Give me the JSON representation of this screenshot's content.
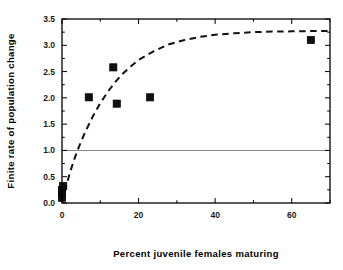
{
  "figure": {
    "background_color": "#ffffff",
    "frame_color": "#000000",
    "marker_color": "#111111",
    "curve_color": "#111111",
    "reference_line_color": "#8c8c8c"
  },
  "axes": {
    "x_title": "Percent juvenile females maturing",
    "y_title": "Finite rate of population change",
    "x_ticks": [
      "0",
      "20",
      "40",
      "60"
    ],
    "y_ticks": [
      "0.0",
      "0.5",
      "1.0",
      "1.5",
      "2.0",
      "2.5",
      "3.0",
      "3.5"
    ]
  },
  "chart_data": {
    "type": "scatter",
    "title": "",
    "xlabel": "Percent juvenile females maturing",
    "ylabel": "Finite rate of population change",
    "xlim": [
      0,
      70
    ],
    "ylim": [
      0,
      3.5
    ],
    "xticks": [
      0,
      20,
      40,
      60
    ],
    "xticks_minor": [
      10,
      30,
      50,
      70
    ],
    "yticks": [
      0.0,
      0.5,
      1.0,
      1.5,
      2.0,
      2.5,
      3.0,
      3.5
    ],
    "yticks_minor": [
      0.25,
      0.75,
      1.25,
      1.75,
      2.25,
      2.75,
      3.25
    ],
    "grid": false,
    "legend": null,
    "marker": "filled-square",
    "series": [
      {
        "name": "observed populations",
        "type": "scatter",
        "points": [
          {
            "x": 0.0,
            "y": 0.1
          },
          {
            "x": 0.0,
            "y": 0.18
          },
          {
            "x": 0.0,
            "y": 0.25
          },
          {
            "x": 0.3,
            "y": 0.32
          },
          {
            "x": 7.0,
            "y": 2.01
          },
          {
            "x": 13.4,
            "y": 2.58
          },
          {
            "x": 14.3,
            "y": 1.89
          },
          {
            "x": 23.0,
            "y": 2.01
          },
          {
            "x": 65.0,
            "y": 3.1
          }
        ]
      },
      {
        "name": "fitted saturating curve",
        "type": "line",
        "style": "dashed",
        "asymptote": 3.27,
        "points": [
          {
            "x": 0.0,
            "y": 0.02
          },
          {
            "x": 1.0,
            "y": 0.3
          },
          {
            "x": 2.0,
            "y": 0.56
          },
          {
            "x": 3.0,
            "y": 0.79
          },
          {
            "x": 4.0,
            "y": 0.99
          },
          {
            "x": 4.6,
            "y": 1.1
          },
          {
            "x": 6.0,
            "y": 1.34
          },
          {
            "x": 8.0,
            "y": 1.64
          },
          {
            "x": 10.0,
            "y": 1.9
          },
          {
            "x": 12.0,
            "y": 2.12
          },
          {
            "x": 14.0,
            "y": 2.31
          },
          {
            "x": 16.0,
            "y": 2.47
          },
          {
            "x": 18.0,
            "y": 2.6
          },
          {
            "x": 20.0,
            "y": 2.72
          },
          {
            "x": 24.0,
            "y": 2.89
          },
          {
            "x": 28.0,
            "y": 3.02
          },
          {
            "x": 32.0,
            "y": 3.1
          },
          {
            "x": 36.0,
            "y": 3.16
          },
          {
            "x": 40.0,
            "y": 3.2
          },
          {
            "x": 45.0,
            "y": 3.23
          },
          {
            "x": 50.0,
            "y": 3.25
          },
          {
            "x": 55.0,
            "y": 3.26
          },
          {
            "x": 60.0,
            "y": 3.265
          },
          {
            "x": 65.0,
            "y": 3.27
          },
          {
            "x": 70.0,
            "y": 3.27
          }
        ]
      },
      {
        "name": "replacement reference line",
        "type": "hline",
        "style": "solid",
        "color": "#8c8c8c",
        "y": 1.0
      }
    ]
  }
}
